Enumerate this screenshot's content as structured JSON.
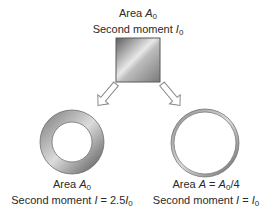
{
  "top": {
    "line1_prefix": "Area ",
    "line1_var": "A",
    "line1_sub": "0",
    "line2_prefix": "Second moment ",
    "line2_var": "I",
    "line2_sub": "0"
  },
  "left": {
    "line1_prefix": "Area ",
    "line1_var": "A",
    "line1_sub": "0",
    "line2_prefix": "Second moment ",
    "line2_var": "I",
    "line2_mid": " = 2.5",
    "line2_var2": "I",
    "line2_sub": "0"
  },
  "right": {
    "line1_prefix": "Area ",
    "line1_var": "A",
    "line1_mid": " = ",
    "line1_var2": "A",
    "line1_sub": "0",
    "line1_suffix": "/4",
    "line2_prefix": "Second moment ",
    "line2_var": "I",
    "line2_mid": " = ",
    "line2_var2": "I",
    "line2_sub": "0"
  },
  "colors": {
    "metal_dark": "#6b6b6b",
    "metal_light": "#f2f2f2",
    "arrow_stroke": "#8a8a8a"
  }
}
